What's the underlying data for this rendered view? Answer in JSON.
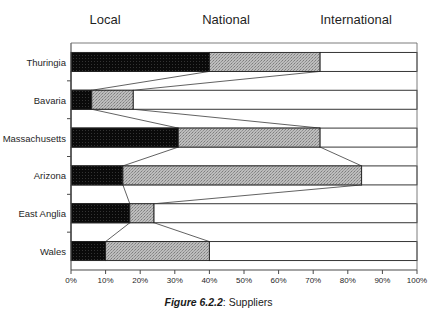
{
  "legend": {
    "entries": [
      {
        "label": "Local",
        "x": 105,
        "color": "#0d0d0d"
      },
      {
        "label": "National",
        "x": 226,
        "color": "#a8a8a8"
      },
      {
        "label": "International",
        "x": 356,
        "color": "#ffffff"
      }
    ]
  },
  "caption": {
    "number": "Figure 6.2.2",
    "separator": ": ",
    "text": "Suppliers"
  },
  "axis": {
    "tick_labels": [
      "0%",
      "10%",
      "20%",
      "30%",
      "40%",
      "50%",
      "60%",
      "70%",
      "80%",
      "90%",
      "100%"
    ],
    "tick_values": [
      0,
      10,
      20,
      30,
      40,
      50,
      60,
      70,
      80,
      90,
      100
    ]
  },
  "chart_data": {
    "type": "bar",
    "orientation": "horizontal",
    "stacked": true,
    "normalized_percent": true,
    "title": "Figure 6.2.2: Suppliers",
    "xlabel": "",
    "ylabel": "",
    "xlim": [
      0,
      100
    ],
    "grid": false,
    "legend_position": "top",
    "categories": [
      "Thuringia",
      "Bavaria",
      "Massachusetts",
      "Arizona",
      "East Anglia",
      "Wales"
    ],
    "series": [
      {
        "name": "Local",
        "color": "#0d0d0d",
        "values": [
          40,
          6,
          31,
          15,
          17,
          10
        ]
      },
      {
        "name": "National",
        "color": "#a8a8a8",
        "values": [
          32,
          12,
          41,
          69,
          7,
          30
        ]
      },
      {
        "name": "International",
        "color": "#ffffff",
        "values": [
          28,
          82,
          28,
          16,
          76,
          60
        ]
      }
    ],
    "cumulative_boundaries": {
      "Thuringia": [
        40,
        72
      ],
      "Bavaria": [
        6,
        18
      ],
      "Massachusetts": [
        31,
        72
      ],
      "Arizona": [
        15,
        84
      ],
      "East Anglia": [
        17,
        24
      ],
      "Wales": [
        10,
        40
      ]
    }
  },
  "colors": {
    "local": "#0d0d0d",
    "national": "#a8a8a8",
    "international": "#ffffff",
    "axis": "#555555",
    "outline": "#2b2b2b",
    "background": "#ffffff"
  }
}
